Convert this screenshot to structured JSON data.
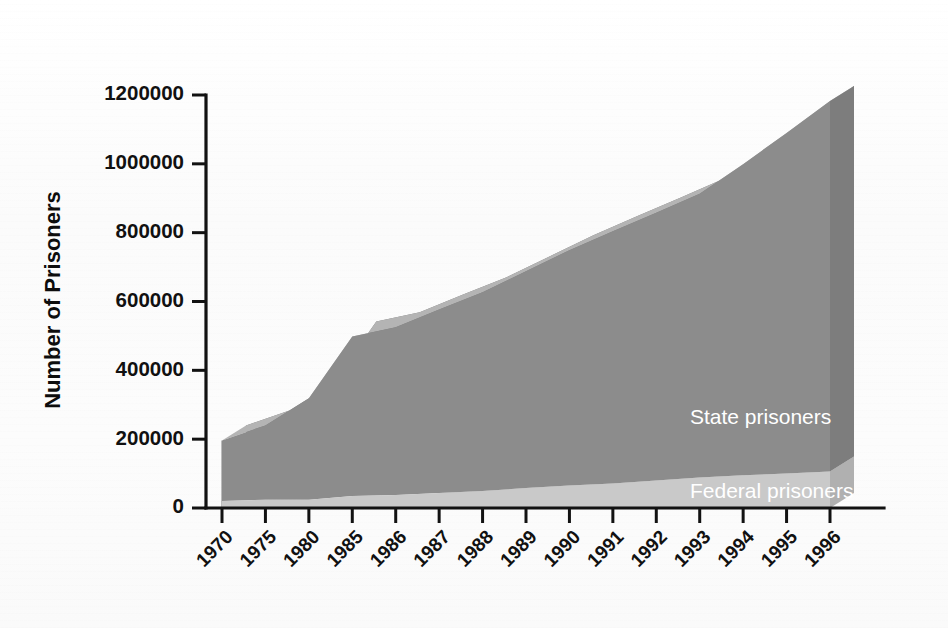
{
  "chart_data": {
    "type": "area",
    "title": "",
    "subtitle": "",
    "xlabel": "",
    "ylabel": "Number of Prisoners",
    "categories": [
      "1970",
      "1975",
      "1980",
      "1985",
      "1986",
      "1987",
      "1988",
      "1989",
      "1990",
      "1991",
      "1992",
      "1993",
      "1994",
      "1995",
      "1996"
    ],
    "ylim": [
      0,
      1200000
    ],
    "yticks": [
      0,
      200000,
      400000,
      600000,
      800000,
      1000000,
      1200000
    ],
    "ytick_labels": [
      "0",
      "200000",
      "400000",
      "600000",
      "800000",
      "1000000",
      "1200000"
    ],
    "grid": false,
    "legend_position": "inline-annotation",
    "stacked": true,
    "style": "3d-extruded-area",
    "series": [
      {
        "name": "Federal prisoners",
        "label": "Federal prisoners",
        "color": "#c9c9c9",
        "values": [
          20000,
          24000,
          24000,
          35000,
          38000,
          44000,
          49000,
          58000,
          65000,
          71000,
          80000,
          89000,
          95000,
          100000,
          106000
        ]
      },
      {
        "name": "State prisoners",
        "label": "State prisoners",
        "color": "#8c8c8c",
        "values": [
          176000,
          216000,
          295000,
          463000,
          487000,
          533000,
          578000,
          630000,
          684000,
          733000,
          778000,
          824000,
          904000,
          990000,
          1077000
        ]
      }
    ],
    "totals": [
      196000,
      240000,
      319000,
      498000,
      525000,
      577000,
      627000,
      688000,
      749000,
      804000,
      858000,
      913000,
      999000,
      1090000,
      1183000
    ],
    "annotations": [
      {
        "text": "State prisoners",
        "series": "State prisoners",
        "color": "#ffffff"
      },
      {
        "text": "Federal prisoners",
        "series": "Federal prisoners",
        "color": "#ffffff"
      }
    ]
  },
  "colors": {
    "state_front": "#8c8c8c",
    "state_top": "#b4b4b4",
    "state_side": "#7d7d7d",
    "federal_front": "#c9c9c9",
    "federal_top": "#dcdcdc",
    "federal_side": "#b0b0b0",
    "axis": "#121212",
    "background": "#fdfdfd",
    "label_text": "#ffffff"
  },
  "axis_titles": {
    "y": "Number of Prisoners"
  }
}
